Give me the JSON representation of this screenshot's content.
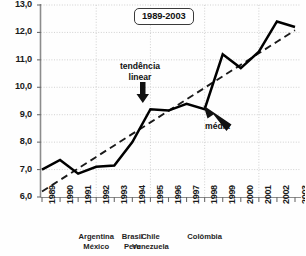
{
  "chart_data": {
    "type": "line",
    "title": "1989-2003",
    "xlabel": "",
    "ylabel": "",
    "ylim": [
      6.0,
      13.0
    ],
    "yticks": [
      "6,0",
      "7,0",
      "8,0",
      "9,0",
      "10,0",
      "11,0",
      "12,0",
      "13,0"
    ],
    "ytick_values": [
      6.0,
      7.0,
      8.0,
      9.0,
      10.0,
      11.0,
      12.0,
      13.0
    ],
    "grid": true,
    "legend_position": "none",
    "categories": [
      "1989",
      "1990",
      "1991",
      "1992",
      "1993",
      "1994",
      "1995",
      "1996",
      "1997",
      "1998",
      "1999",
      "2000",
      "2001",
      "2002",
      "2003"
    ],
    "series": [
      {
        "name": "média",
        "style": "solid-bold",
        "values": [
          7.0,
          7.35,
          6.85,
          7.1,
          7.15,
          8.0,
          9.2,
          9.15,
          9.4,
          9.2,
          11.2,
          10.7,
          11.3,
          12.4,
          12.2
        ]
      },
      {
        "name": "tendência linear",
        "style": "dashed",
        "values": [
          6.2,
          6.62,
          7.04,
          7.46,
          7.88,
          8.3,
          8.72,
          9.14,
          9.56,
          9.98,
          10.4,
          10.82,
          11.24,
          11.66,
          12.08
        ]
      }
    ],
    "annotations": [
      {
        "text_line1": "tendência",
        "text_line2": "linear",
        "arrow": "down"
      },
      {
        "text_line1": "média",
        "text_line2": "",
        "arrow": "up-left"
      }
    ],
    "country_groups": [
      {
        "labels": [
          "Argentina",
          "México"
        ],
        "at_year": "1992"
      },
      {
        "labels": [
          "Brasil",
          "Peru"
        ],
        "at_year": "1994"
      },
      {
        "labels": [
          "Chile",
          "Venezuela"
        ],
        "at_year": "1995"
      },
      {
        "labels": [
          "Colômbia",
          ""
        ],
        "at_year": "1998"
      }
    ]
  },
  "colors": {
    "series_line": "#000000",
    "trend_line": "#1a1a1a",
    "grid": "#cccccc",
    "axis": "#888888",
    "text": "#111111",
    "background": "#fefefe"
  }
}
